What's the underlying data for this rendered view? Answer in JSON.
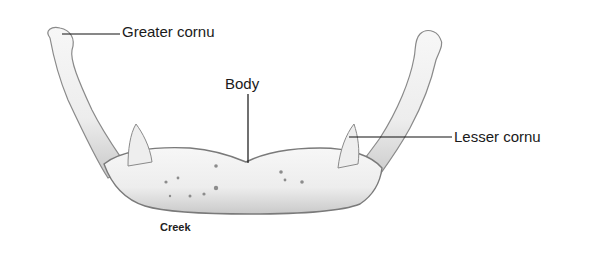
{
  "diagram": {
    "labels": [
      {
        "id": "greater_cornu",
        "text": "Greater cornu"
      },
      {
        "id": "body",
        "text": "Body"
      },
      {
        "id": "lesser_cornu",
        "text": "Lesser cornu"
      }
    ],
    "credit": "Creek",
    "colors": {
      "bone_fill": "#f2f2f2",
      "bone_shade": "#b8b8b8",
      "bone_outline": "#8a8a8a",
      "leader_line": "#111111",
      "text": "#1a1a1a"
    }
  }
}
